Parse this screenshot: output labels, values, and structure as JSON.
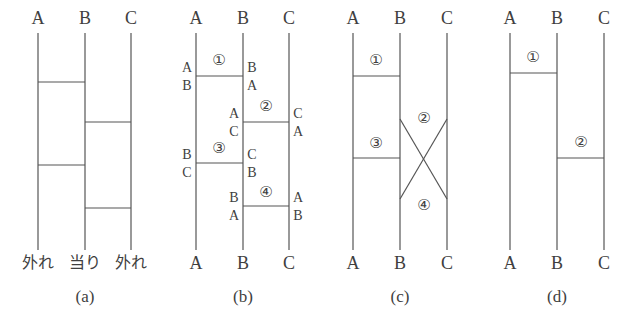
{
  "figure": {
    "type": "amidakuji-ghost-leg-diagram",
    "width": 624,
    "height": 320,
    "line_color": "#555555",
    "text_color": "#3f3f3f",
    "background": "#ffffff"
  },
  "panels": [
    {
      "caption": "(a)",
      "caption_x": 85,
      "caption_y": 296,
      "top_labels": [
        {
          "text": "A",
          "x": 38,
          "y": 18
        },
        {
          "text": "B",
          "x": 85,
          "y": 18
        },
        {
          "text": "C",
          "x": 131,
          "y": 18
        }
      ],
      "bottom_labels": [
        {
          "text": "外れ",
          "x": 38,
          "y": 263
        },
        {
          "text": "当り",
          "x": 85,
          "y": 263
        },
        {
          "text": "外れ",
          "x": 131,
          "y": 263
        }
      ],
      "verticals": [
        {
          "x": 38,
          "y1": 33,
          "y2": 250
        },
        {
          "x": 85,
          "y1": 33,
          "y2": 250
        },
        {
          "x": 131,
          "y1": 33,
          "y2": 250
        }
      ],
      "rungs": [
        {
          "x1": 38,
          "x2": 85,
          "y": 82
        },
        {
          "x1": 85,
          "x2": 131,
          "y": 122
        },
        {
          "x1": 38,
          "x2": 85,
          "y": 165
        },
        {
          "x1": 85,
          "x2": 131,
          "y": 208
        }
      ],
      "numbers": [],
      "side_labels": []
    },
    {
      "caption": "(b)",
      "caption_x": 243,
      "caption_y": 296,
      "top_labels": [
        {
          "text": "A",
          "x": 196,
          "y": 18
        },
        {
          "text": "B",
          "x": 243,
          "y": 18
        },
        {
          "text": "C",
          "x": 289,
          "y": 18
        }
      ],
      "bottom_labels": [
        {
          "text": "A",
          "x": 196,
          "y": 263
        },
        {
          "text": "B",
          "x": 243,
          "y": 263
        },
        {
          "text": "C",
          "x": 289,
          "y": 263
        }
      ],
      "verticals": [
        {
          "x": 196,
          "y1": 33,
          "y2": 250
        },
        {
          "x": 243,
          "y1": 33,
          "y2": 250
        },
        {
          "x": 289,
          "y1": 33,
          "y2": 250
        }
      ],
      "rungs": [
        {
          "x1": 196,
          "x2": 243,
          "y": 76
        },
        {
          "x1": 243,
          "x2": 289,
          "y": 122
        },
        {
          "x1": 196,
          "x2": 243,
          "y": 163
        },
        {
          "x1": 243,
          "x2": 289,
          "y": 206
        }
      ],
      "numbers": [
        {
          "text": "①",
          "x": 219,
          "y": 60
        },
        {
          "text": "②",
          "x": 266,
          "y": 106
        },
        {
          "text": "③",
          "x": 219,
          "y": 148
        },
        {
          "text": "④",
          "x": 266,
          "y": 192
        }
      ],
      "side_labels": [
        {
          "text": "A",
          "x": 187,
          "y": 68
        },
        {
          "text": "B",
          "x": 187,
          "y": 86
        },
        {
          "text": "B",
          "x": 252,
          "y": 68
        },
        {
          "text": "A",
          "x": 252,
          "y": 86
        },
        {
          "text": "A",
          "x": 234,
          "y": 114
        },
        {
          "text": "C",
          "x": 234,
          "y": 132
        },
        {
          "text": "C",
          "x": 298,
          "y": 114
        },
        {
          "text": "A",
          "x": 298,
          "y": 132
        },
        {
          "text": "B",
          "x": 187,
          "y": 155
        },
        {
          "text": "C",
          "x": 187,
          "y": 173
        },
        {
          "text": "C",
          "x": 252,
          "y": 155
        },
        {
          "text": "B",
          "x": 252,
          "y": 173
        },
        {
          "text": "B",
          "x": 234,
          "y": 198
        },
        {
          "text": "A",
          "x": 234,
          "y": 216
        },
        {
          "text": "A",
          "x": 298,
          "y": 198
        },
        {
          "text": "B",
          "x": 298,
          "y": 216
        }
      ]
    },
    {
      "caption": "(c)",
      "caption_x": 400,
      "caption_y": 296,
      "top_labels": [
        {
          "text": "A",
          "x": 353,
          "y": 18
        },
        {
          "text": "B",
          "x": 400,
          "y": 18
        },
        {
          "text": "C",
          "x": 447,
          "y": 18
        }
      ],
      "bottom_labels": [
        {
          "text": "A",
          "x": 353,
          "y": 263
        },
        {
          "text": "B",
          "x": 400,
          "y": 263
        },
        {
          "text": "C",
          "x": 447,
          "y": 263
        }
      ],
      "verticals": [
        {
          "x": 353,
          "y1": 33,
          "y2": 250
        },
        {
          "x": 400,
          "y1": 33,
          "y2": 250
        },
        {
          "x": 447,
          "y1": 33,
          "y2": 250
        }
      ],
      "rungs": [
        {
          "x1": 353,
          "x2": 400,
          "y": 76
        },
        {
          "x1": 353,
          "x2": 400,
          "y": 158
        }
      ],
      "crossings": [
        {
          "x1": 400,
          "y1": 119,
          "x2": 447,
          "y2": 199
        },
        {
          "x1": 447,
          "y1": 119,
          "x2": 400,
          "y2": 199
        }
      ],
      "numbers": [
        {
          "text": "①",
          "x": 376,
          "y": 60
        },
        {
          "text": "②",
          "x": 424,
          "y": 118
        },
        {
          "text": "③",
          "x": 376,
          "y": 143
        },
        {
          "text": "④",
          "x": 424,
          "y": 205
        }
      ],
      "side_labels": []
    },
    {
      "caption": "(d)",
      "caption_x": 557,
      "caption_y": 296,
      "top_labels": [
        {
          "text": "A",
          "x": 510,
          "y": 18
        },
        {
          "text": "B",
          "x": 557,
          "y": 18
        },
        {
          "text": "C",
          "x": 604,
          "y": 18
        }
      ],
      "bottom_labels": [
        {
          "text": "A",
          "x": 510,
          "y": 263
        },
        {
          "text": "B",
          "x": 557,
          "y": 263
        },
        {
          "text": "C",
          "x": 604,
          "y": 263
        }
      ],
      "verticals": [
        {
          "x": 510,
          "y1": 33,
          "y2": 250
        },
        {
          "x": 557,
          "y1": 33,
          "y2": 250
        },
        {
          "x": 604,
          "y1": 33,
          "y2": 250
        }
      ],
      "rungs": [
        {
          "x1": 510,
          "x2": 557,
          "y": 73
        },
        {
          "x1": 557,
          "x2": 604,
          "y": 158
        }
      ],
      "numbers": [
        {
          "text": "①",
          "x": 533,
          "y": 57
        },
        {
          "text": "②",
          "x": 581,
          "y": 142
        }
      ],
      "side_labels": []
    }
  ]
}
